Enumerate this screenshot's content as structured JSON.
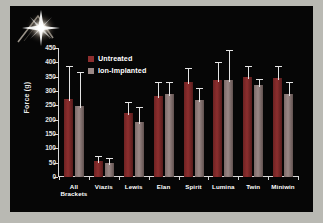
{
  "slide": {
    "background_color": "#060606",
    "frame_color": "#b9b9b3",
    "logo_name": "starburst-flare-logo"
  },
  "legend": {
    "position": "inside-top-left",
    "entries": [
      {
        "label": "Untreated",
        "color": "#8d2e2e"
      },
      {
        "label": "Ion-Implanted",
        "color": "#9a8886"
      }
    ]
  },
  "chart_data": {
    "type": "bar",
    "title": "",
    "xlabel": "",
    "ylabel": "Force (g)",
    "ylim": [
      0,
      450
    ],
    "yticks": [
      0,
      50,
      100,
      150,
      200,
      250,
      300,
      350,
      400,
      450
    ],
    "ytick_labels": [
      "0",
      "50",
      "100",
      "150",
      "200",
      "250",
      "300",
      "350",
      "400",
      "450"
    ],
    "grid": false,
    "categories": [
      "All\nBrackets",
      "Viazis",
      "Lewis",
      "Elan",
      "Spirit",
      "Lumina",
      "Twin",
      "Miniwin"
    ],
    "category_labels": [
      [
        "All",
        "Brackets"
      ],
      [
        "Viazis"
      ],
      [
        "Lewis"
      ],
      [
        "Elan"
      ],
      [
        "Spirit"
      ],
      [
        "Lumina"
      ],
      [
        "Twin"
      ],
      [
        "Miniwin"
      ]
    ],
    "series": [
      {
        "name": "Untreated",
        "color": "#8d2e2e",
        "values": [
          272,
          55,
          222,
          282,
          330,
          340,
          348,
          347
        ],
        "errors": [
          116,
          20,
          40,
          50,
          50,
          62,
          38,
          40
        ]
      },
      {
        "name": "Ion-Implanted",
        "color": "#9a8886",
        "values": [
          248,
          48,
          193,
          291,
          267,
          337,
          320,
          288
        ],
        "errors": [
          118,
          20,
          53,
          42,
          42,
          105,
          23,
          42
        ]
      }
    ]
  }
}
